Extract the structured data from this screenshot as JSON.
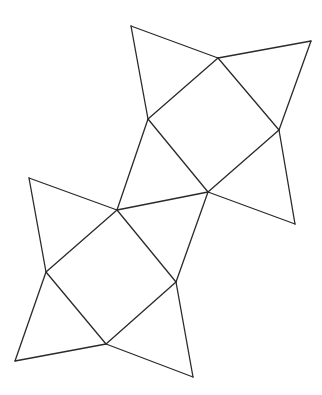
{
  "diagram": {
    "type": "polyhedron-net",
    "stroke_color": "#2a2a2a",
    "background": "#ffffff",
    "vertices": {
      "A": [
        131,
        26
      ],
      "B": [
        218,
        58
      ],
      "C": [
        311,
        41
      ],
      "D": [
        148,
        119
      ],
      "E": [
        279,
        130
      ],
      "F": [
        208,
        192
      ],
      "G": [
        295,
        224
      ],
      "H": [
        117,
        210
      ],
      "I": [
        29,
        178
      ],
      "J": [
        46,
        272
      ],
      "K": [
        176,
        282
      ],
      "L": [
        106,
        344
      ],
      "M": [
        15,
        361
      ],
      "N": [
        193,
        377
      ]
    },
    "edges": [
      [
        "A",
        "B"
      ],
      [
        "A",
        "D"
      ],
      [
        "B",
        "C"
      ],
      [
        "C",
        "E"
      ],
      [
        "B",
        "D"
      ],
      [
        "B",
        "E"
      ],
      [
        "D",
        "F"
      ],
      [
        "E",
        "F"
      ],
      [
        "E",
        "G"
      ],
      [
        "F",
        "G"
      ],
      [
        "D",
        "H"
      ],
      [
        "H",
        "F"
      ],
      [
        "H",
        "I"
      ],
      [
        "I",
        "J"
      ],
      [
        "H",
        "J"
      ],
      [
        "H",
        "K"
      ],
      [
        "F",
        "K"
      ],
      [
        "J",
        "L"
      ],
      [
        "K",
        "L"
      ],
      [
        "J",
        "M"
      ],
      [
        "M",
        "L"
      ],
      [
        "K",
        "N"
      ],
      [
        "L",
        "N"
      ]
    ]
  }
}
